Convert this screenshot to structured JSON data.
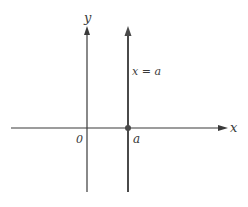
{
  "diagram": {
    "axes": {
      "x_label": "x",
      "y_label": "y",
      "origin_label": "0"
    },
    "vertical_line": {
      "equation": "x = a",
      "point_label": "a"
    },
    "colors": {
      "axis": "#3a3a3a",
      "line": "#4a4a4a",
      "point": "#4a4a4a",
      "text": "#3a3a3a"
    }
  }
}
